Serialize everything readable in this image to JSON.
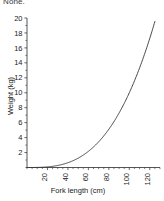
{
  "caption": {
    "top_text": "None."
  },
  "chart_data": {
    "type": "line",
    "title": "",
    "subtitle": "",
    "xlabel": "Fork length (cm)",
    "ylabel": "Weight (kg)",
    "xlim": [
      0,
      130
    ],
    "ylim": [
      0,
      20
    ],
    "grid": false,
    "legend": null,
    "x_ticks": [
      20,
      40,
      60,
      80,
      100,
      120
    ],
    "x_tick_labels": [
      "20",
      "40",
      "60",
      "80",
      "100",
      "120"
    ],
    "x_tick_rotation": 90,
    "x_minor_tick_step": 5,
    "y_ticks": [
      2,
      4,
      6,
      8,
      10,
      12,
      14,
      16,
      18,
      20
    ],
    "y_tick_labels": [
      "2",
      "4",
      "6",
      "8",
      "10",
      "12",
      "14",
      "16",
      "18",
      "20"
    ],
    "y_minor_tick_step": 1,
    "series": [
      {
        "name": "length-weight relationship",
        "color": "#333333",
        "x": [
          10,
          20,
          30,
          40,
          50,
          60,
          70,
          80,
          90,
          100,
          110,
          120,
          125
        ],
        "values": [
          0.01,
          0.08,
          0.27,
          0.64,
          1.25,
          2.16,
          3.43,
          5.12,
          7.29,
          10.0,
          13.31,
          17.28,
          19.53
        ]
      }
    ]
  }
}
